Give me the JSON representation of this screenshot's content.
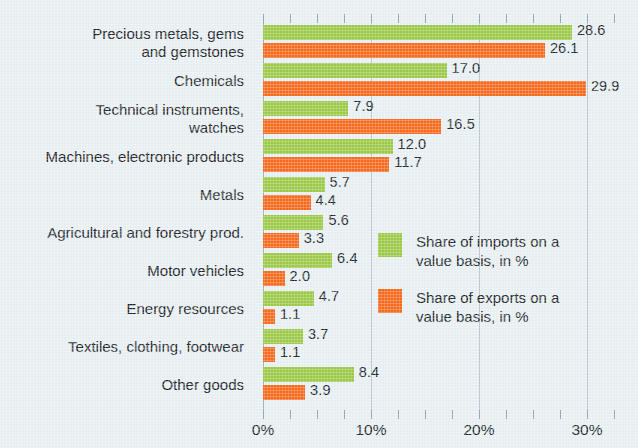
{
  "chart_data": {
    "type": "bar",
    "orientation": "horizontal",
    "title": "",
    "xlabel": "",
    "ylabel": "",
    "xlim": [
      0,
      32.5
    ],
    "xticks": [
      0,
      10,
      20,
      30
    ],
    "xtick_labels": [
      "0%",
      "10%",
      "20%",
      "30%"
    ],
    "grid": true,
    "legend_position": "inside-right-middle",
    "categories": [
      "Precious metals, gems\nand gemstones",
      "Chemicals",
      "Technical instruments,\nwatches",
      "Machines, electronic products",
      "Metals",
      "Agricultural and forestry prod.",
      "Motor vehicles",
      "Energy resources",
      "Textiles, clothing, footwear",
      "Other goods"
    ],
    "series": [
      {
        "name": "Share of imports on a\nvalue basis, in %",
        "color": "#9cc847",
        "values": [
          28.6,
          17.0,
          7.9,
          12.0,
          5.7,
          5.6,
          6.4,
          4.7,
          3.7,
          8.4
        ],
        "labels": [
          "28.6",
          "17.0",
          "7.9",
          "12.0",
          "5.7",
          "5.6",
          "6.4",
          "4.7",
          "3.7",
          "8.4"
        ]
      },
      {
        "name": "Share of exports on a\nvalue basis, in %",
        "color": "#f4691c",
        "values": [
          26.1,
          29.9,
          16.5,
          11.7,
          4.4,
          3.3,
          2.0,
          1.1,
          1.1,
          3.9
        ],
        "labels": [
          "26.1",
          "29.9",
          "16.5",
          "11.7",
          "4.4",
          "3.3",
          "2.0",
          "1.1",
          "1.1",
          "3.9"
        ]
      }
    ]
  },
  "legend": {
    "entries": [
      {
        "label": "Share of imports on a\nvalue basis, in %",
        "color": "#9cc847"
      },
      {
        "label": "Share of exports on a\nvalue basis, in %",
        "color": "#f4691c"
      }
    ]
  },
  "colors": {
    "background": "#e7eef2",
    "imports": "#9cc847",
    "exports": "#f4691c",
    "gridline": "#b9c7cd",
    "text": "#1d2428"
  }
}
